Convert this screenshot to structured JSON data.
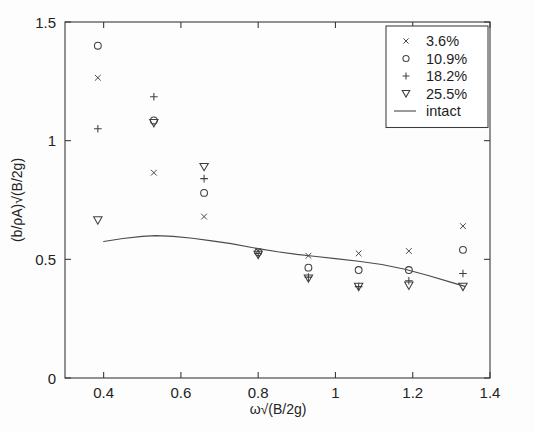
{
  "chart_data": {
    "type": "scatter",
    "title": "",
    "xlabel": "ω√(B/2g)",
    "ylabel": "(b/ρA)√(B/2g)",
    "xlim": [
      0.3,
      1.4
    ],
    "ylim": [
      0,
      1.5
    ],
    "xticks": [
      0.4,
      0.6,
      0.8,
      1.0,
      1.2,
      1.4
    ],
    "xticklabels": [
      "0.4",
      "0.6",
      "0.8",
      "1",
      "1.2",
      "1.4"
    ],
    "yticks": [
      0,
      0.5,
      1.0,
      1.5
    ],
    "yticklabels": [
      "0",
      "0.5",
      "1",
      "1.5"
    ],
    "grid": false,
    "legend_position": "top-right",
    "series": [
      {
        "name": "3.6%",
        "marker": "cross",
        "type": "scatter",
        "x": [
          0.385,
          0.53,
          0.66,
          0.8,
          0.93,
          1.06,
          1.19,
          1.33
        ],
        "y": [
          1.265,
          0.865,
          0.68,
          0.535,
          0.515,
          0.525,
          0.535,
          0.64
        ]
      },
      {
        "name": "10.9%",
        "marker": "circle",
        "type": "scatter",
        "x": [
          0.385,
          0.53,
          0.66,
          0.8,
          0.93,
          1.06,
          1.19,
          1.33
        ],
        "y": [
          1.4,
          1.085,
          0.78,
          0.53,
          0.465,
          0.455,
          0.455,
          0.54
        ]
      },
      {
        "name": "18.2%",
        "marker": "plus",
        "type": "scatter",
        "x": [
          0.385,
          0.53,
          0.66,
          0.8,
          0.93,
          1.06,
          1.19,
          1.33
        ],
        "y": [
          1.05,
          1.185,
          0.84,
          0.525,
          0.425,
          0.385,
          0.41,
          0.44
        ]
      },
      {
        "name": "25.5%",
        "marker": "triangle-down",
        "type": "scatter",
        "x": [
          0.385,
          0.53,
          0.66,
          0.8,
          0.93,
          1.06,
          1.19,
          1.33
        ],
        "y": [
          0.665,
          1.075,
          0.89,
          0.52,
          0.42,
          0.385,
          0.39,
          0.385
        ]
      },
      {
        "name": "intact",
        "marker": "none",
        "type": "line",
        "x": [
          0.4,
          0.45,
          0.5,
          0.535,
          0.58,
          0.63,
          0.68,
          0.73,
          0.78,
          0.8,
          0.85,
          0.9,
          0.95,
          1.0,
          1.06,
          1.12,
          1.18,
          1.24,
          1.3,
          1.335
        ],
        "y": [
          0.575,
          0.588,
          0.597,
          0.6,
          0.597,
          0.589,
          0.578,
          0.566,
          0.551,
          0.545,
          0.532,
          0.521,
          0.512,
          0.503,
          0.492,
          0.478,
          0.458,
          0.432,
          0.403,
          0.386
        ]
      }
    ]
  },
  "legend": {
    "entries": [
      {
        "label": "3.6%",
        "marker": "cross"
      },
      {
        "label": "10.9%",
        "marker": "circle"
      },
      {
        "label": "18.2%",
        "marker": "plus"
      },
      {
        "label": "25.5%",
        "marker": "triangle-down"
      },
      {
        "label": "intact",
        "marker": "line"
      }
    ]
  }
}
